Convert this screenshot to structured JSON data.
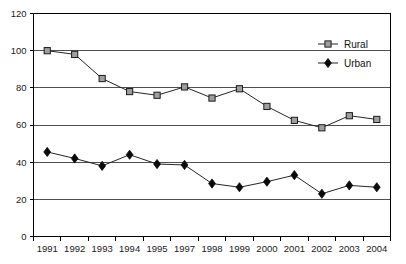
{
  "chart_data": {
    "type": "line",
    "title": "",
    "subtitle": "",
    "xlabel": "",
    "ylabel": "",
    "categories": [
      "1991",
      "1992",
      "1993",
      "1994",
      "1995",
      "1997",
      "1998",
      "1999",
      "2000",
      "2001",
      "2002",
      "2003",
      "2004"
    ],
    "series": [
      {
        "name": "Rural",
        "marker": "square",
        "marker_fill": "#9e9e9e",
        "marker_stroke": "#1c1c1c",
        "values": [
          100,
          98,
          85,
          78,
          76,
          80.5,
          74.5,
          79.5,
          70,
          62.5,
          58.5,
          65,
          63
        ]
      },
      {
        "name": "Urban",
        "marker": "diamond",
        "marker_fill": "#0a0a0a",
        "marker_stroke": "#0a0a0a",
        "values": [
          45.5,
          42,
          38,
          44,
          39,
          38.5,
          28.5,
          26.5,
          29.5,
          33,
          23,
          27.5,
          26.5
        ]
      }
    ],
    "ylim": [
      0,
      120
    ],
    "yticks": [
      0,
      20,
      40,
      60,
      80,
      100,
      120
    ],
    "ytick_labels": [
      "0",
      "20",
      "40",
      "60",
      "80",
      "100",
      "120"
    ],
    "grid": "horizontal",
    "legend_position": "top-right",
    "line_color": "#262626",
    "axis_color": "#000000",
    "grid_color": "#3d3d3d",
    "background": "#ffffff"
  },
  "legend": {
    "entries": [
      {
        "label": "Rural"
      },
      {
        "label": "Urban"
      }
    ]
  }
}
